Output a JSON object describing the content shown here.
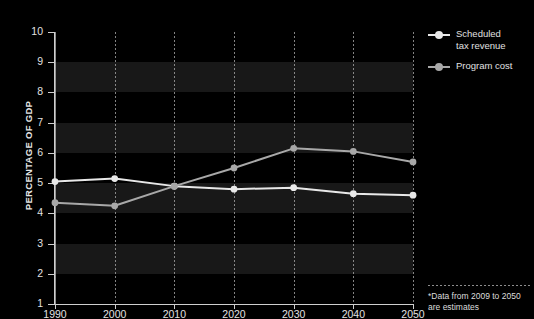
{
  "chart_data": {
    "type": "line",
    "title": "",
    "xlabel": "",
    "ylabel": "PERCENTAGE OF GDP",
    "x": [
      1990,
      2000,
      2010,
      2020,
      2030,
      2040,
      2050
    ],
    "xticklabels": [
      "1990",
      "2000",
      "2010",
      "2020",
      "2030",
      "2040",
      "2050"
    ],
    "yticklabels": [
      "1",
      "2",
      "3",
      "4",
      "5",
      "6",
      "7",
      "8",
      "9",
      "10"
    ],
    "ylim": [
      1,
      10
    ],
    "xlim": [
      1990,
      2050
    ],
    "grid": "vertical-dotted-with-horizontal-bands",
    "legend_position": "right-top",
    "series": [
      {
        "name": "Scheduled\ntax revenue",
        "color": "#e8e8e8",
        "values": [
          5.05,
          5.15,
          4.9,
          4.8,
          4.85,
          4.65,
          4.6
        ]
      },
      {
        "name": "Program cost",
        "color": "#a8a8a8",
        "values": [
          4.35,
          4.25,
          4.9,
          5.5,
          6.15,
          6.05,
          5.7
        ]
      }
    ],
    "footnote": "*Data from 2009 to 2050\nare estimates",
    "background_color": "#000000",
    "band_color": "#181818",
    "axis_color": "#cfcfcf",
    "text_color": "#e2e2e2"
  },
  "legend": {
    "items": [
      {
        "label": "Scheduled\ntax revenue"
      },
      {
        "label": "Program cost"
      }
    ]
  }
}
